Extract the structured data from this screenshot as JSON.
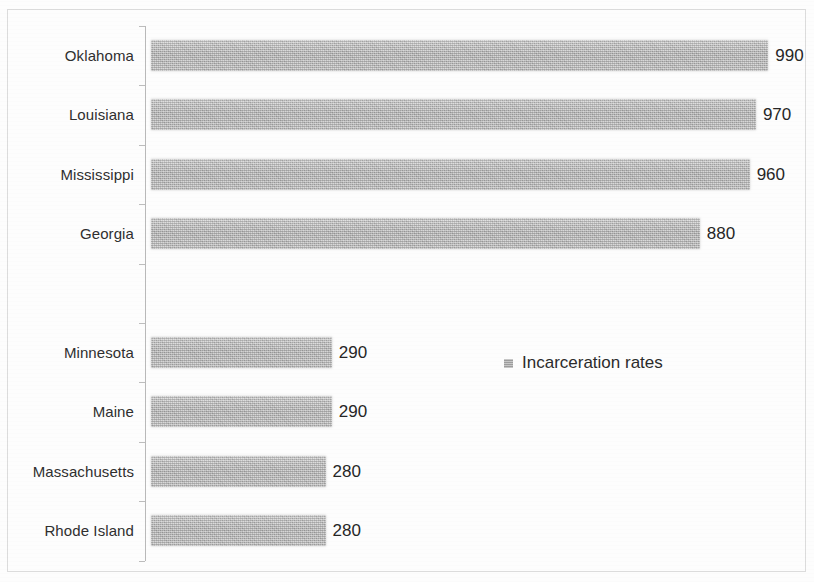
{
  "chart_data": {
    "type": "bar",
    "orientation": "horizontal",
    "title": "",
    "xlabel": "",
    "ylabel": "",
    "grid": false,
    "legend_position": "middle-right",
    "xlim": [
      0,
      1000
    ],
    "categories": [
      "Oklahoma",
      "Louisiana",
      "Mississippi",
      "Georgia",
      "",
      "Minnesota",
      "Maine",
      "Massachusetts",
      "Rhode Island"
    ],
    "values": [
      990,
      970,
      960,
      880,
      null,
      290,
      290,
      280,
      280
    ],
    "series": [
      {
        "name": "Incarceration rates",
        "values": [
          990,
          970,
          960,
          880,
          null,
          290,
          290,
          280,
          280
        ]
      }
    ],
    "legend": [
      "Incarceration rates"
    ],
    "data_labels": [
      "990",
      "970",
      "960",
      "880",
      "",
      "290",
      "290",
      "280",
      "280"
    ],
    "bar_color": "#aeaeae"
  },
  "legend": {
    "label": "Incarceration rates",
    "swatch_color": "#aeaeae"
  },
  "rows": [
    {
      "label": "Oklahoma",
      "value": 990,
      "value_label": "990"
    },
    {
      "label": "Louisiana",
      "value": 970,
      "value_label": "970"
    },
    {
      "label": "Mississippi",
      "value": 960,
      "value_label": "960"
    },
    {
      "label": "Georgia",
      "value": 880,
      "value_label": "880"
    },
    {
      "label": "",
      "value": 0,
      "value_label": ""
    },
    {
      "label": "Minnesota",
      "value": 290,
      "value_label": "290"
    },
    {
      "label": "Maine",
      "value": 290,
      "value_label": "290"
    },
    {
      "label": "Massachusetts",
      "value": 280,
      "value_label": "280"
    },
    {
      "label": "Rhode Island",
      "value": 280,
      "value_label": "280"
    }
  ]
}
